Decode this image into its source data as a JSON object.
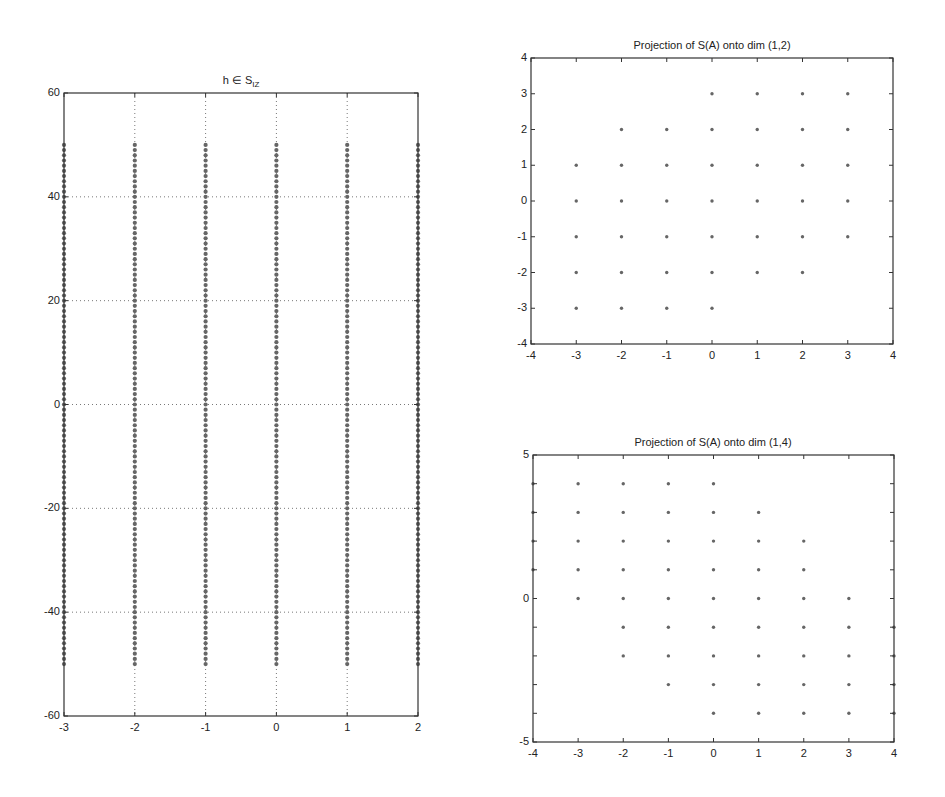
{
  "chart_data": [
    {
      "id": "left",
      "type": "scatter",
      "title": "h ∈ S",
      "title_subscript": "IZ",
      "xlabel": "",
      "ylabel": "",
      "xlim": [
        -3,
        2
      ],
      "ylim": [
        -60,
        60
      ],
      "xticks": [
        -3,
        -2,
        -1,
        0,
        1,
        2
      ],
      "yticks": [
        -60,
        -40,
        -20,
        0,
        20,
        40,
        60
      ],
      "grid": true,
      "marker_color": "#666666",
      "description": "Dense vertical columns of points at each integer x from -3 to 2, each spanning every integer y from -50 to 50",
      "columns_x": [
        -3,
        -2,
        -1,
        0,
        1,
        2
      ],
      "column_y_range": [
        -50,
        50
      ],
      "column_y_step": 1,
      "box": {
        "left": 64,
        "top": 93,
        "right": 418,
        "bottom": 716
      }
    },
    {
      "id": "top-right",
      "type": "scatter",
      "title": "Projection of S(A) onto dim (1,2)",
      "xlabel": "",
      "ylabel": "",
      "xlim": [
        -4,
        4
      ],
      "ylim": [
        -4,
        4
      ],
      "xticks": [
        -4,
        -3,
        -2,
        -1,
        0,
        1,
        2,
        3,
        4
      ],
      "yticks": [
        -4,
        -3,
        -2,
        -1,
        0,
        1,
        2,
        3,
        4
      ],
      "grid": false,
      "marker_color": "#666666",
      "rows": [
        {
          "y": 3,
          "x_from": 0,
          "x_to": 3
        },
        {
          "y": 2,
          "x_from": -2,
          "x_to": 3
        },
        {
          "y": 1,
          "x_from": -3,
          "x_to": 3
        },
        {
          "y": 0,
          "x_from": -3,
          "x_to": 3
        },
        {
          "y": -1,
          "x_from": -3,
          "x_to": 3
        },
        {
          "y": -2,
          "x_from": -3,
          "x_to": 2
        },
        {
          "y": -3,
          "x_from": -3,
          "x_to": 0
        }
      ],
      "box": {
        "left": 531,
        "top": 58,
        "right": 893,
        "bottom": 344
      }
    },
    {
      "id": "bottom-right",
      "type": "scatter",
      "title": "Projection of S(A) onto dim (1,4)",
      "xlabel": "",
      "ylabel": "",
      "xlim": [
        -4,
        4
      ],
      "ylim": [
        -5,
        5
      ],
      "xticks": [
        -4,
        -3,
        -2,
        -1,
        0,
        1,
        2,
        3,
        4
      ],
      "yticks": [
        -5,
        0,
        5
      ],
      "minor_yticks": [
        -4,
        -3,
        -2,
        -1,
        1,
        2,
        3,
        4
      ],
      "grid": false,
      "marker_color": "#666666",
      "rows": [
        {
          "y": 4,
          "x_from": -4,
          "x_to": 0
        },
        {
          "y": 3,
          "x_from": -4,
          "x_to": 1
        },
        {
          "y": 2,
          "x_from": -4,
          "x_to": 2
        },
        {
          "y": 1,
          "x_from": -4,
          "x_to": 2
        },
        {
          "y": 0,
          "x_from": -3,
          "x_to": 3
        },
        {
          "y": -1,
          "x_from": -2,
          "x_to": 4
        },
        {
          "y": -2,
          "x_from": -2,
          "x_to": 4
        },
        {
          "y": -3,
          "x_from": -1,
          "x_to": 4
        },
        {
          "y": -4,
          "x_from": 0,
          "x_to": 4
        }
      ],
      "box": {
        "left": 533,
        "top": 455,
        "right": 894,
        "bottom": 742
      }
    }
  ],
  "labels": {
    "left_title": "h ∈ S",
    "left_title_sub": "IZ",
    "tr_title": "Projection of S(A) onto dim (1,2)",
    "br_title": "Projection of S(A) onto dim (1,4)"
  }
}
